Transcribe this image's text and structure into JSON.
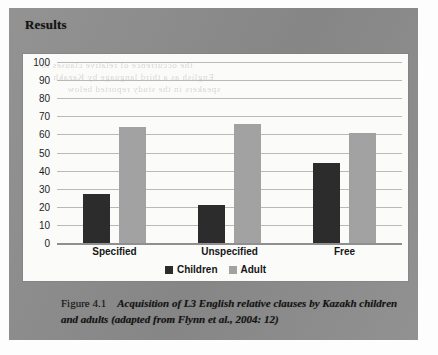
{
  "page": {
    "section_heading": "Results"
  },
  "bleed_through": {
    "line1": "the occurrence of relative clauses in",
    "line2": "English as a third language by Kazakh",
    "line3": "speakers in the study reported below"
  },
  "legend": {
    "items": [
      {
        "label": "Children",
        "color": "#2c2c2c",
        "icon": "square-swatch"
      },
      {
        "label": "Adult",
        "color": "#a2a2a2",
        "icon": "square-swatch"
      }
    ]
  },
  "caption": {
    "number": "Figure 4.1",
    "text": "Acquisition of L3 English relative clauses by Kazakh children and adults (adapted from Flynn et al., 2004: 12)"
  },
  "chart_data": {
    "type": "bar",
    "title": "",
    "xlabel": "",
    "ylabel": "",
    "ylim": [
      0,
      100
    ],
    "ytick_step": 10,
    "yticks": [
      100,
      90,
      80,
      70,
      60,
      50,
      40,
      30,
      20,
      10,
      0
    ],
    "grid": true,
    "legend_position": "bottom-center",
    "categories": [
      "Specified",
      "Unspecified",
      "Free"
    ],
    "series": [
      {
        "name": "Children",
        "color": "#2c2c2c",
        "values": [
          27,
          21,
          44
        ]
      },
      {
        "name": "Adult",
        "color": "#a2a2a2",
        "values": [
          64,
          66,
          61
        ]
      }
    ]
  }
}
